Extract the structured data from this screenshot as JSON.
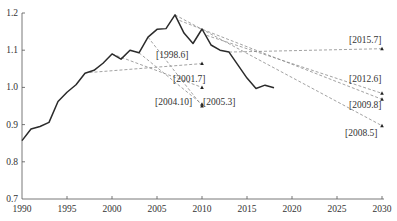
{
  "chart_data": {
    "type": "line",
    "title": "",
    "xlabel": "",
    "ylabel": "",
    "xlim": [
      1990,
      2030
    ],
    "ylim": [
      0.7,
      1.2
    ],
    "x_ticks": [
      "1990",
      "1995",
      "2000",
      "2005",
      "2010",
      "2015",
      "2020",
      "2025",
      "2030"
    ],
    "y_ticks": [
      "0.7",
      "0.8",
      "0.9",
      "1.0",
      "1.1",
      "1.2"
    ],
    "grid": false,
    "legend": null,
    "series": [
      {
        "name": "Actual",
        "style": "solid",
        "points": [
          [
            1990,
            0.857
          ],
          [
            1991,
            0.888
          ],
          [
            1992,
            0.895
          ],
          [
            1993,
            0.906
          ],
          [
            1994,
            0.962
          ],
          [
            1995,
            0.987
          ],
          [
            1996,
            1.007
          ],
          [
            1997,
            1.038
          ],
          [
            1998,
            1.046
          ],
          [
            1999,
            1.065
          ],
          [
            2000,
            1.09
          ],
          [
            2001,
            1.076
          ],
          [
            2002,
            1.1
          ],
          [
            2003,
            1.093
          ],
          [
            2004,
            1.135
          ],
          [
            2005,
            1.156
          ],
          [
            2006,
            1.158
          ],
          [
            2007,
            1.195
          ],
          [
            2008,
            1.146
          ],
          [
            2009,
            1.118
          ],
          [
            2010,
            1.157
          ],
          [
            2011,
            1.114
          ],
          [
            2012,
            1.1
          ],
          [
            2013,
            1.095
          ],
          [
            2014,
            1.06
          ],
          [
            2015,
            1.025
          ],
          [
            2016,
            0.997
          ],
          [
            2017,
            1.006
          ],
          [
            2018,
            0.999
          ]
        ]
      }
    ],
    "forecasts": [
      {
        "label": "[1998.6]",
        "start": [
          1997.5,
          1.04
        ],
        "end": [
          2010,
          1.064
        ]
      },
      {
        "label": "[2001.7]",
        "start": [
          2000,
          1.09
        ],
        "end": [
          2010,
          1.0
        ]
      },
      {
        "label": "[2004.10]",
        "start": [
          2003,
          1.093
        ],
        "end": [
          2010,
          0.955
        ]
      },
      {
        "label": "[2005.3]",
        "start": [
          2004,
          1.135
        ],
        "end": [
          2010,
          0.95
        ]
      },
      {
        "label": "[2008.5]",
        "start": [
          2007,
          1.195
        ],
        "end": [
          2030,
          0.897
        ]
      },
      {
        "label": "[2009.8]",
        "start": [
          2007.5,
          1.18
        ],
        "end": [
          2030,
          0.968
        ]
      },
      {
        "label": "[2012.6]",
        "start": [
          2010.5,
          1.14
        ],
        "end": [
          2030,
          0.984
        ]
      },
      {
        "label": "[2015.7]",
        "start": [
          2013,
          1.095
        ],
        "end": [
          2030,
          1.104
        ]
      }
    ],
    "annotations": [
      "[1998.6]",
      "[2001.7]",
      "[2004.10]",
      "[2005.3]",
      "[2015.7]",
      "[2012.6]",
      "[2009.8]",
      "[2008.5]"
    ]
  },
  "labels": {
    "f_1998_6": "[1998.6]",
    "f_2001_7": "[2001.7]",
    "f_2004_10": "[2004.10]",
    "f_2005_3": "[2005.3]",
    "f_2015_7": "[2015.7]",
    "f_2012_6": "[2012.6]",
    "f_2009_8": "[2009.8]",
    "f_2008_5": "[2008.5]"
  },
  "axes": {
    "x": [
      "1990",
      "1995",
      "2000",
      "2005",
      "2010",
      "2015",
      "2020",
      "2025",
      "2030"
    ],
    "y": [
      "1.2",
      "1.1",
      "1.0",
      "0.9",
      "0.8",
      "0.7"
    ]
  }
}
